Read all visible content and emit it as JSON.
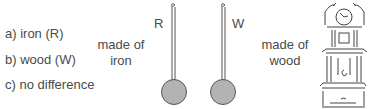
{
  "options": [
    {
      "label": "a) iron (R)"
    },
    {
      "label": "b) wood (W)"
    },
    {
      "label": "c) no difference"
    }
  ],
  "iron_caption": {
    "line1": "made of",
    "line2": "iron"
  },
  "wood_caption": {
    "line1": "made of",
    "line2": "wood"
  },
  "pendulums": [
    {
      "label": "R",
      "material": "iron"
    },
    {
      "label": "W",
      "material": "wood"
    }
  ],
  "colors": {
    "text": "#4a4a4a",
    "bob_fill": "#b3b3b3",
    "bob_stroke": "#555555",
    "line": "#444444"
  }
}
